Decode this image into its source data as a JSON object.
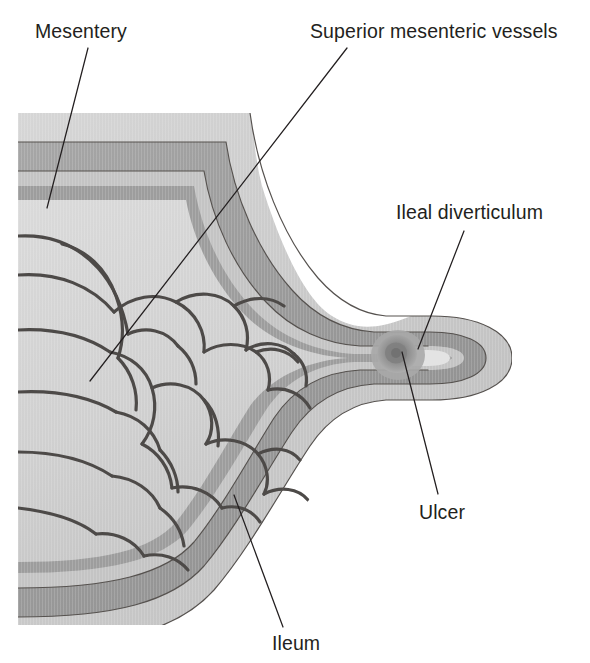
{
  "figure": {
    "background_color": "#ffffff",
    "illustration_bounds": {
      "x": 18,
      "y": 113,
      "width": 494,
      "height": 510
    }
  },
  "labels": {
    "mesentery": {
      "text": "Mesentery",
      "x": 35,
      "y": 38,
      "anchor": "start",
      "leader": {
        "x1": 88,
        "y1": 48,
        "x2": 47,
        "y2": 208
      }
    },
    "superior_mesenteric_vessels": {
      "text": "Superior mesenteric vessels",
      "x": 310,
      "y": 38,
      "anchor": "start",
      "leader": {
        "x1": 347,
        "y1": 48,
        "x2": 90,
        "y2": 381
      }
    },
    "ileal_diverticulum": {
      "text": "Ileal diverticulum",
      "x": 396,
      "y": 219,
      "anchor": "start",
      "leader": {
        "x1": 464,
        "y1": 231,
        "x2": 418,
        "y2": 349
      }
    },
    "ulcer": {
      "text": "Ulcer",
      "x": 419,
      "y": 519,
      "anchor": "start",
      "leader": {
        "x1": 438,
        "y1": 494,
        "x2": 402,
        "y2": 352
      }
    },
    "ileum": {
      "text": "Ileum",
      "x": 272,
      "y": 650,
      "anchor": "start",
      "leader": {
        "x1": 283,
        "y1": 627,
        "x2": 234,
        "y2": 495
      }
    }
  },
  "anatomy": {
    "layers": [
      {
        "name": "serosa-outer",
        "color": "#c9c9c9",
        "description": "pale grey outer serosal coat"
      },
      {
        "name": "muscularis-propria",
        "color": "#9a9a9a",
        "description": "mid-grey muscular band"
      },
      {
        "name": "submucosa",
        "color": "#bfbfbf",
        "description": "light grey submucosal band"
      },
      {
        "name": "mucosa-inner",
        "color": "#9a9a9a",
        "description": "grey mucosal lining band"
      },
      {
        "name": "lumen",
        "color": "#ffffff",
        "description": "white bowel lumen"
      },
      {
        "name": "mesentery-fan",
        "color": "#d2d2d2",
        "description": "pale grey mesenteric fat fan"
      },
      {
        "name": "vessel",
        "color": "#4a4a4a",
        "description": "dark grey arterial arcade vessels"
      },
      {
        "name": "ulcer-crater",
        "color": "#8e8e8e",
        "description": "darker round ulcer crater at diverticular neck"
      }
    ],
    "structures": [
      "ileum wall with four concentric coats",
      "mesentery with vascular arcades and vasa recta",
      "ileal (Meckel's) diverticulum projecting from antimesenteric border",
      "peptic ulcer at the base of the diverticulum"
    ]
  },
  "colors": {
    "ink": "#231f20",
    "paper": "#ffffff",
    "tone_lightest": "#dcdcdc",
    "tone_light": "#c9c9c9",
    "tone_mid": "#b0b0b0",
    "tone_dark": "#9a9a9a",
    "tone_darkest": "#7d7d7d",
    "vessel_stroke": "#4a4a4a"
  }
}
